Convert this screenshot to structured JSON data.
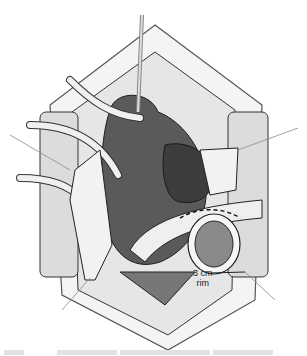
{
  "figure": {
    "labels": {
      "rim_line1": "3 cm",
      "rim_line2": "rim"
    },
    "leader_lines": [
      "upper-left",
      "upper-right",
      "lower-left",
      "lower-right"
    ],
    "colors": {
      "background": "#ffffff",
      "dark_organ": "#4a4a4a",
      "mid_organ": "#6e6e6e",
      "light_tissue": "#e4e4e4",
      "retractor": "#d6d6d6",
      "outline": "#1a1a1a",
      "leader": "#8a8a8a"
    }
  }
}
